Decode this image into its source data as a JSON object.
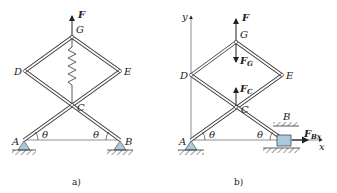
{
  "figure_a": {
    "caption": "a)",
    "points": {
      "A": "A",
      "B": "B",
      "C": "C",
      "D": "D",
      "E": "E",
      "G": "G"
    },
    "force": {
      "symbol": "F"
    },
    "angle_left": "θ",
    "angle_right": "θ",
    "has_spring": true
  },
  "figure_b": {
    "caption": "b)",
    "points": {
      "A": "A",
      "B": "B",
      "C": "C",
      "D": "D",
      "E": "E",
      "G": "G"
    },
    "axes": {
      "x": "x",
      "y": "y"
    },
    "forces": {
      "F": {
        "symbol": "F",
        "sub": ""
      },
      "FG": {
        "symbol": "F",
        "sub": "G"
      },
      "FC": {
        "symbol": "F",
        "sub": "C"
      },
      "FBx": {
        "symbol": "F",
        "sub": "Bx"
      }
    },
    "angle_left": "θ",
    "angle_right": "θ"
  },
  "colors": {
    "bar_outline": "#3a3a3a",
    "bar_fill": "#ffffff",
    "support_fill": "#a9c9dc",
    "hatch": "#3a3a3a",
    "text": "#222222"
  }
}
